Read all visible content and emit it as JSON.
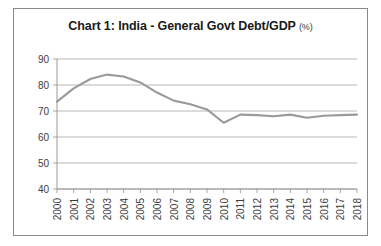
{
  "chart_data": {
    "type": "line",
    "title": "Chart 1: India - General Govt Debt/GDP",
    "title_suffix": "(%)",
    "xlabel": "",
    "ylabel": "",
    "grid": true,
    "legend": false,
    "ylim": [
      40,
      90
    ],
    "yticks": [
      40,
      50,
      60,
      70,
      80,
      90
    ],
    "categories": [
      "2000",
      "2001",
      "2002",
      "2003",
      "2004",
      "2005",
      "2006",
      "2007",
      "2008",
      "2009",
      "2010",
      "2011",
      "2012",
      "2013",
      "2014",
      "2015",
      "2016",
      "2017",
      "2018"
    ],
    "series": [
      {
        "name": "General Govt Debt/GDP",
        "color": "#9a9a9a",
        "values": [
          73.6,
          78.7,
          82.3,
          84.0,
          83.3,
          81.0,
          77.1,
          74.0,
          72.6,
          70.6,
          65.5,
          68.6,
          68.4,
          68.0,
          68.6,
          67.4,
          68.2,
          68.4,
          68.6
        ]
      }
    ]
  }
}
